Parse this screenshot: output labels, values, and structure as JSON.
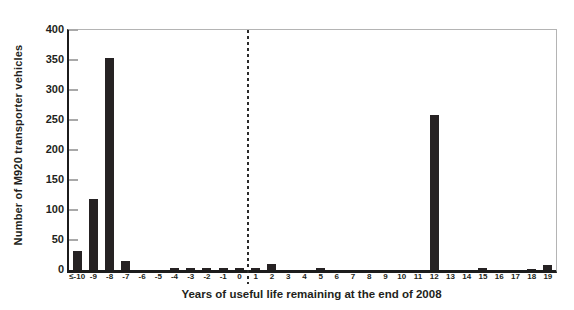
{
  "chart_data": {
    "type": "bar",
    "title": "",
    "xlabel": "Years of useful life remaining at the end of 2008",
    "ylabel": "Number of M920 transporter vehicles",
    "categories": [
      "≤-10",
      "-9",
      "-8",
      "-7",
      "-6",
      "-5",
      "-4",
      "-3",
      "-2",
      "-1",
      "0",
      "1",
      "2",
      "3",
      "4",
      "5",
      "6",
      "7",
      "8",
      "9",
      "10",
      "11",
      "12",
      "13",
      "14",
      "15",
      "16",
      "17",
      "18",
      "19"
    ],
    "values": [
      32,
      118,
      353,
      15,
      0,
      0,
      4,
      4,
      4,
      4,
      4,
      4,
      10,
      0,
      0,
      3,
      0,
      0,
      0,
      0,
      0,
      0,
      259,
      0,
      0,
      3,
      0,
      0,
      2,
      8
    ],
    "ylim": [
      0,
      400
    ],
    "yticks": [
      0,
      50,
      100,
      150,
      200,
      250,
      300,
      350,
      400
    ],
    "grid": false,
    "legend": false,
    "bar_color": "#262223",
    "axis_color": "#1c1c1c",
    "frame_color": "#b4b4b4",
    "divider": {
      "style": "dashed",
      "between_categories": [
        "0",
        "1"
      ],
      "color": "#2b2b2b"
    }
  }
}
